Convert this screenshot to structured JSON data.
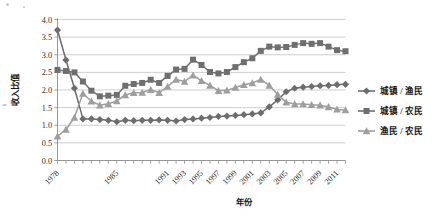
{
  "chart_data": {
    "type": "line",
    "title": "",
    "xlabel": "年份",
    "ylabel": "收入比值",
    "ylim": [
      0.0,
      4.0
    ],
    "ytick_step": 0.5,
    "ytick_labels": [
      "0.0",
      "0.5",
      "1.0",
      "1.5",
      "2.0",
      "2.5",
      "3.0",
      "3.5",
      "4.0"
    ],
    "grid": "horizontal",
    "legend_position": "right",
    "x": [
      1978,
      1979,
      1980,
      1981,
      1982,
      1983,
      1984,
      1985,
      1986,
      1987,
      1988,
      1989,
      1990,
      1991,
      1992,
      1993,
      1994,
      1995,
      1996,
      1997,
      1998,
      1999,
      2000,
      2001,
      2002,
      2003,
      2004,
      2005,
      2006,
      2007,
      2008,
      2009,
      2010,
      2011,
      2012
    ],
    "xtick_labels": [
      "1978",
      "1985",
      "1991",
      "1993",
      "1995",
      "1997",
      "1999",
      "2001",
      "2003",
      "2005",
      "2007",
      "2009",
      "2011"
    ],
    "xtick_label_years": [
      1978,
      1985,
      1991,
      1993,
      1995,
      1997,
      1999,
      2001,
      2003,
      2005,
      2007,
      2009,
      2011
    ],
    "series": [
      {
        "name": "城镇 / 渔民",
        "marker": "diamond",
        "color": "#6d6d6d",
        "values": [
          3.7,
          2.85,
          2.05,
          1.18,
          1.18,
          1.16,
          1.14,
          1.1,
          1.14,
          1.13,
          1.14,
          1.14,
          1.15,
          1.14,
          1.12,
          1.16,
          1.18,
          1.2,
          1.22,
          1.25,
          1.26,
          1.28,
          1.3,
          1.32,
          1.35,
          1.52,
          1.72,
          1.95,
          2.05,
          2.08,
          2.1,
          2.12,
          2.13,
          2.15,
          2.16
        ]
      },
      {
        "name": "城镇 / 农民",
        "marker": "square",
        "color": "#6f6f6f",
        "values": [
          2.57,
          2.54,
          2.5,
          2.24,
          1.98,
          1.82,
          1.84,
          1.86,
          2.12,
          2.17,
          2.2,
          2.29,
          2.2,
          2.4,
          2.58,
          2.6,
          2.86,
          2.71,
          2.51,
          2.47,
          2.51,
          2.65,
          2.79,
          2.9,
          3.11,
          3.23,
          3.21,
          3.22,
          3.28,
          3.33,
          3.31,
          3.33,
          3.23,
          3.13,
          3.1
        ]
      },
      {
        "name": "渔民 / 农民",
        "marker": "triangle",
        "color": "#9e9e9e",
        "values": [
          0.69,
          0.88,
          1.22,
          1.9,
          1.68,
          1.57,
          1.61,
          1.69,
          1.86,
          1.92,
          1.93,
          2.01,
          1.92,
          2.1,
          2.3,
          2.24,
          2.42,
          2.26,
          2.13,
          1.98,
          1.99,
          2.07,
          2.15,
          2.2,
          2.3,
          2.13,
          1.87,
          1.65,
          1.6,
          1.6,
          1.58,
          1.57,
          1.52,
          1.45,
          1.43
        ]
      }
    ]
  },
  "legend": {
    "items": [
      {
        "label": "城镇 / 渔民"
      },
      {
        "label": "城镇 / 农民"
      },
      {
        "label": "渔民 / 农民"
      }
    ]
  },
  "axes": {
    "y_title": "收入比值",
    "x_title": "年份"
  }
}
